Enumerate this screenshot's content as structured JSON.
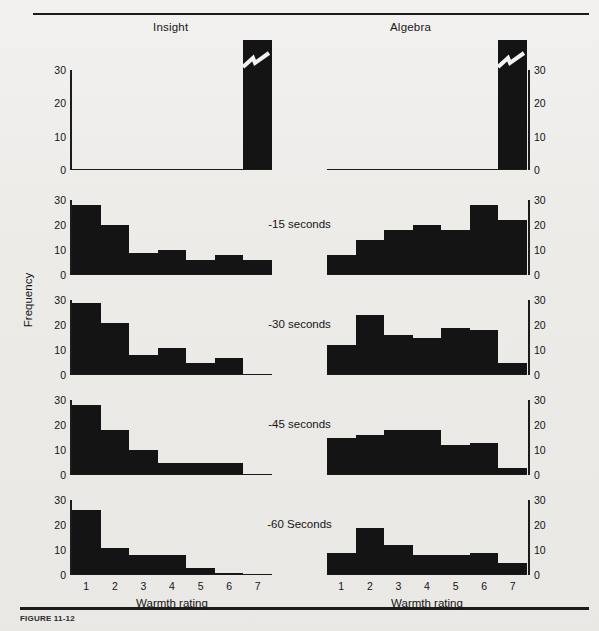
{
  "figure": {
    "caption": "FIGURE 11-12",
    "columns": [
      "Insight",
      "Algebra"
    ],
    "y_axis_label": "Frequency",
    "x_axis_label": "Warmth rating",
    "x_ticks": [
      "1",
      "2",
      "3",
      "4",
      "5",
      "6",
      "7"
    ],
    "y_ticks": [
      "0",
      "10",
      "20",
      "30"
    ],
    "row_notes": [
      "",
      "-15 seconds",
      "-30 seconds",
      "-45 seconds",
      "-60 Seconds"
    ],
    "bar_color": "#141414",
    "axis_color": "#1b1b1b",
    "page_color": "#ecebe8"
  },
  "chart_data": {
    "type": "bar",
    "xlabel": "Warmth rating",
    "ylabel": "Frequency",
    "categories": [
      "1",
      "2",
      "3",
      "4",
      "5",
      "6",
      "7"
    ],
    "ylim": [
      0,
      30
    ],
    "y_ticks": [
      0,
      10,
      20,
      30
    ],
    "grid": false,
    "legend": "none",
    "note": "Top row y-axis is broken; bar at rating 7 exceeds the 30 scale maximum.",
    "panels": [
      {
        "row": 0,
        "time_note": "",
        "axis_broken": true,
        "series": [
          {
            "name": "Insight",
            "values": [
              0,
              0,
              0,
              0,
              0,
              0,
              42
            ]
          },
          {
            "name": "Algebra",
            "values": [
              0,
              0,
              0,
              0,
              0,
              0,
              42
            ]
          }
        ]
      },
      {
        "row": 1,
        "time_note": "-15 seconds",
        "axis_broken": false,
        "series": [
          {
            "name": "Insight",
            "values": [
              28,
              20,
              9,
              10,
              6,
              8,
              6
            ]
          },
          {
            "name": "Algebra",
            "values": [
              8,
              14,
              18,
              20,
              18,
              28,
              22
            ]
          }
        ]
      },
      {
        "row": 2,
        "time_note": "-30 seconds",
        "axis_broken": false,
        "series": [
          {
            "name": "Insight",
            "values": [
              29,
              21,
              8,
              11,
              5,
              7,
              0
            ]
          },
          {
            "name": "Algebra",
            "values": [
              12,
              24,
              16,
              15,
              19,
              18,
              5
            ]
          }
        ]
      },
      {
        "row": 3,
        "time_note": "-45 seconds",
        "axis_broken": false,
        "series": [
          {
            "name": "Insight",
            "values": [
              28,
              18,
              10,
              5,
              5,
              5,
              0
            ]
          },
          {
            "name": "Algebra",
            "values": [
              15,
              16,
              18,
              18,
              12,
              13,
              3
            ]
          }
        ]
      },
      {
        "row": 4,
        "time_note": "-60 Seconds",
        "axis_broken": false,
        "series": [
          {
            "name": "Insight",
            "values": [
              26,
              11,
              8,
              8,
              3,
              1,
              0
            ]
          },
          {
            "name": "Algebra",
            "values": [
              9,
              19,
              12,
              8,
              8,
              9,
              5
            ]
          }
        ]
      }
    ]
  }
}
